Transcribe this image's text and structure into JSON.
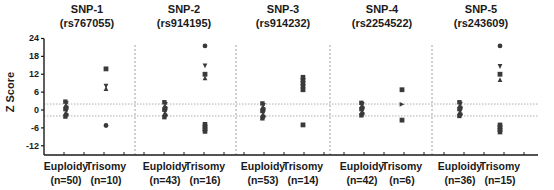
{
  "chart_data": {
    "type": "scatter",
    "ylabel": "Z Score",
    "ylim": [
      -14,
      24
    ],
    "yticks": [
      24,
      18,
      12,
      6,
      0,
      -6,
      -12
    ],
    "threshold_lines": [
      2,
      -2
    ],
    "colors": {
      "points": "#3a3a3a",
      "threshold": "#9a9a9a",
      "separator": "#8a8a8a",
      "axis": "#1a1a1a"
    },
    "panels": [
      {
        "title": "SNP-1",
        "subtitle": "(rs767055)",
        "groups": [
          {
            "label": "Euploidy",
            "n_label": "(n=50)",
            "n": 50,
            "range": [
              -2.2,
              2.8
            ]
          },
          {
            "label": "Trisomy",
            "n_label": "(n=10)",
            "n": 10,
            "points": [
              {
                "y": 13.8,
                "marker": "square"
              },
              {
                "y": 8.0,
                "marker": "triangle-down"
              },
              {
                "y": 7.2,
                "marker": "triangle-up"
              },
              {
                "y": -5.2,
                "marker": "circle"
              }
            ]
          }
        ]
      },
      {
        "title": "SNP-2",
        "subtitle": "(rs914195)",
        "groups": [
          {
            "label": "Euploidy",
            "n_label": "(n=43)",
            "n": 43,
            "range": [
              -2.4,
              2.6
            ]
          },
          {
            "label": "Trisomy",
            "n_label": "(n=16)",
            "n": 16,
            "points": [
              {
                "y": 21.5,
                "marker": "circle"
              },
              {
                "y": 14.8,
                "marker": "triangle-down"
              },
              {
                "y": 12.0,
                "marker": "square"
              },
              {
                "y": 10.8,
                "marker": "triangle-up"
              }
            ],
            "cluster": [
              -7.2,
              -4.8
            ]
          }
        ]
      },
      {
        "title": "SNP-3",
        "subtitle": "(rs914232)",
        "groups": [
          {
            "label": "Euploidy",
            "n_label": "(n=53)",
            "n": 53,
            "range": [
              -2.8,
              2.2
            ]
          },
          {
            "label": "Trisomy",
            "n_label": "(n=14)",
            "n": 14,
            "points": [
              {
                "y": 6.8,
                "marker": "square"
              },
              {
                "y": -5.0,
                "marker": "square"
              }
            ],
            "cluster": [
              8.0,
              11.0
            ]
          }
        ]
      },
      {
        "title": "SNP-4",
        "subtitle": "(rs2254522)",
        "groups": [
          {
            "label": "Euploidy",
            "n_label": "(n=42)",
            "n": 42,
            "range": [
              -1.8,
              2.4
            ]
          },
          {
            "label": "Trisomy",
            "n_label": "(n=6)",
            "n": 6,
            "points": [
              {
                "y": 6.8,
                "marker": "square"
              },
              {
                "y": 1.9,
                "marker": "triangle-right"
              },
              {
                "y": -3.4,
                "marker": "square"
              }
            ]
          }
        ]
      },
      {
        "title": "SNP-5",
        "subtitle": "(rs243609)",
        "groups": [
          {
            "label": "Euploidy",
            "n_label": "(n=36)",
            "n": 36,
            "range": [
              -2.0,
              2.6
            ]
          },
          {
            "label": "Trisomy",
            "n_label": "(n=15)",
            "n": 15,
            "points": [
              {
                "y": 21.5,
                "marker": "circle"
              },
              {
                "y": 14.6,
                "marker": "triangle-down"
              },
              {
                "y": 12.0,
                "marker": "square"
              },
              {
                "y": 10.2,
                "marker": "triangle-up"
              }
            ],
            "cluster": [
              -7.4,
              -5.0
            ]
          }
        ]
      }
    ]
  }
}
